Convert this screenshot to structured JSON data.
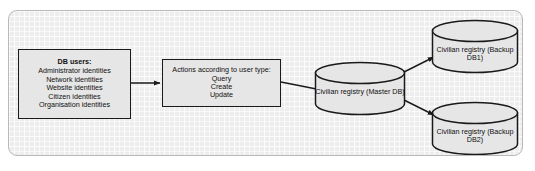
{
  "diagram": {
    "background_color": "#ededed",
    "frame_border_color": "#b9b9b9",
    "node_fill_color": "#e6e6e6",
    "node_stroke_color": "#1a1a1a",
    "text_color": "#111111",
    "nodes": {
      "db_users": {
        "heading": "DB users:",
        "items": [
          "Administrator identities",
          "Network identities",
          "Website identities",
          "Citizen identities",
          "Organisation identities"
        ]
      },
      "actions": {
        "heading": "Actions according to user type:",
        "items": [
          "Query",
          "Create",
          "Update"
        ]
      },
      "master_db": {
        "label": "Civilian registry (Master DB)"
      },
      "backup_db1": {
        "label": "Civilian registry (Backup DB1)"
      },
      "backup_db2": {
        "label": "Civilian registry (Backup DB2)"
      }
    },
    "arrows": [
      {
        "name": "db-users-to-actions",
        "from": "db_users",
        "to": "actions",
        "label": ""
      },
      {
        "name": "actions-to-master-db",
        "from": "actions",
        "to": "master_db",
        "label": ""
      },
      {
        "name": "master-db-to-backup-db1",
        "from": "master_db",
        "to": "backup_db1",
        "label": ""
      },
      {
        "name": "master-db-to-backup-db2",
        "from": "master_db",
        "to": "backup_db2",
        "label": ""
      }
    ]
  }
}
